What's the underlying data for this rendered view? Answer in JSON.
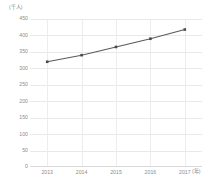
{
  "chart_data": {
    "type": "line",
    "title": "",
    "subtitle": "",
    "xlabel": "(年)",
    "ylabel": "(千人)",
    "categories": [
      "2013",
      "2014",
      "2015",
      "2016",
      "2017"
    ],
    "x": [
      2013,
      2014,
      2015,
      2016,
      2017
    ],
    "values": [
      320,
      340,
      365,
      390,
      418
    ],
    "series": [
      {
        "name": "",
        "values": [
          320,
          340,
          365,
          390,
          418
        ]
      }
    ],
    "ylim": [
      0,
      450
    ],
    "yticks": [
      0,
      50,
      100,
      150,
      200,
      250,
      300,
      350,
      400,
      450
    ],
    "ytick_labels": [
      "0",
      "50",
      "100",
      "150",
      "200",
      "250",
      "300",
      "350",
      "400",
      "450"
    ],
    "xtick_labels": [
      "2013",
      "2014",
      "2015",
      "2016",
      "2017"
    ],
    "grid": true,
    "grid_axis": "both",
    "legend": false,
    "legend_position": "none",
    "marker": "square",
    "line_color": "#595959",
    "marker_color": "#4a4a4a",
    "grid_color": "#e9e9e9",
    "text_color": "#8c8c8c",
    "background_color": "#ffffff"
  },
  "axes": {
    "y_unit_label": "(千人)",
    "x_unit_label": "(年)"
  }
}
